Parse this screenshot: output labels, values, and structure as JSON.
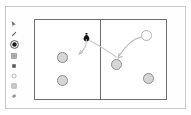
{
  "window": {
    "title": ""
  },
  "toolbar": {
    "name": "drawing-tools",
    "items": [
      {
        "id": "pointer",
        "icon": "cursor-arrow-icon",
        "label": "Select",
        "active": false
      },
      {
        "id": "pencil",
        "icon": "pencil-icon",
        "label": "Draw",
        "active": false
      },
      {
        "id": "circle-fill",
        "icon": "filled-circle-icon",
        "label": "Filled Circle",
        "active": true
      },
      {
        "id": "grid",
        "icon": "grid-icon",
        "label": "Grid",
        "active": false
      },
      {
        "id": "square-fill",
        "icon": "filled-square-icon",
        "label": "Filled Square",
        "active": false
      },
      {
        "id": "circle-outline",
        "icon": "circle-outline-icon",
        "label": "Circle Outline",
        "active": false
      },
      {
        "id": "square-outline",
        "icon": "square-outline-icon",
        "label": "Square Outline",
        "active": false
      },
      {
        "id": "eraser",
        "icon": "eraser-icon",
        "label": "Eraser",
        "active": false
      }
    ]
  },
  "canvas": {
    "name": "two-panel-diagram",
    "divider": "vertical-center-divider",
    "panels": [
      {
        "id": "left-panel",
        "label": "",
        "nodes": [
          {
            "id": "left-node-1",
            "type": "filled",
            "x": 22,
            "y": 32,
            "size": 11,
            "label": ""
          },
          {
            "id": "left-node-2",
            "type": "filled",
            "x": 22,
            "y": 55,
            "size": 11,
            "label": ""
          }
        ],
        "marker": {
          "id": "pin",
          "icon": "pin-marker-icon",
          "x": 48,
          "y": 8,
          "label": ""
        }
      },
      {
        "id": "right-panel",
        "label": "",
        "nodes": [
          {
            "id": "right-node-hollow",
            "type": "hollow",
            "x": 40,
            "y": 10,
            "size": 11,
            "label": ""
          },
          {
            "id": "right-node-target",
            "type": "filled",
            "x": 10,
            "y": 39,
            "size": 11,
            "label": ""
          },
          {
            "id": "right-node-2",
            "type": "filled",
            "x": 42,
            "y": 53,
            "size": 11,
            "label": ""
          }
        ]
      }
    ],
    "arrows": [
      {
        "id": "arrow-pin-to-left",
        "from": "pin",
        "to": "left-panel-lower",
        "style": "curved"
      },
      {
        "id": "arrow-hollow-to-target",
        "from": "right-node-hollow",
        "to": "right-node-target",
        "style": "curved"
      }
    ]
  },
  "colors": {
    "frame_border": "#c9c9c9",
    "canvas_border": "#6e6e6e",
    "node_fill": "#d6d6d6",
    "node_stroke": "#8d8d8d",
    "arrow_stroke": "#b5b5b5",
    "marker_fill": "#1a1a1a",
    "background": "#ffffff"
  }
}
